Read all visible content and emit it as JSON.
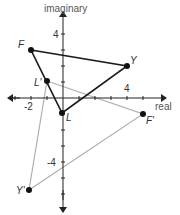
{
  "diagram": {
    "type": "complex-plane-transformation",
    "axes": {
      "x_label": "real",
      "y_label": "imaginary",
      "x_ticks": [
        {
          "value": -2,
          "label": "-2"
        },
        {
          "value": 4,
          "label": "4"
        }
      ],
      "y_ticks": [
        {
          "value": 4,
          "label": "4"
        },
        {
          "value": -4,
          "label": "-4"
        }
      ]
    },
    "original_triangle": {
      "color": "#1a1a1a",
      "vertices": [
        {
          "name": "F",
          "label": "F",
          "x": -2,
          "y": 3
        },
        {
          "name": "Y",
          "label": "Y",
          "x": 4,
          "y": 2
        },
        {
          "name": "L",
          "label": "L",
          "x": 0,
          "y": -1
        }
      ]
    },
    "image_triangle": {
      "color": "#aaaaaa",
      "vertices": [
        {
          "name": "L'",
          "label": "L'",
          "x": -1,
          "y": 1
        },
        {
          "name": "F'",
          "label": "F'",
          "x": 5,
          "y": -1
        },
        {
          "name": "Y'",
          "label": "Y'",
          "x": -2,
          "y": -6
        }
      ]
    }
  }
}
